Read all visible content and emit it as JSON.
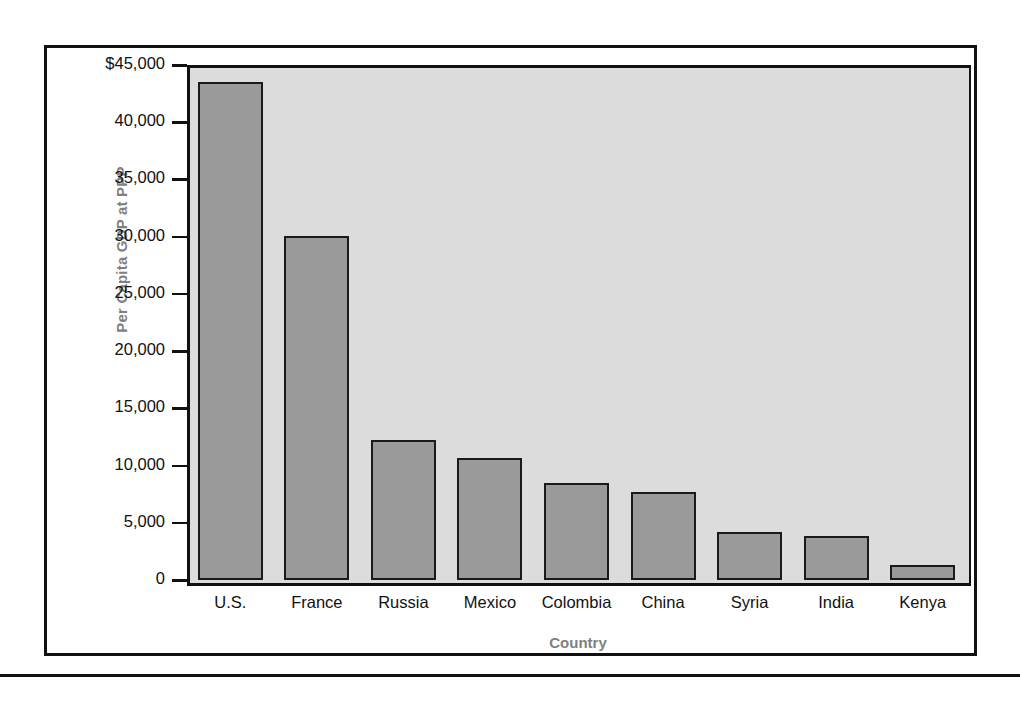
{
  "chart_data": {
    "type": "bar",
    "title": "",
    "xlabel": "Country",
    "ylabel": "Per Capita GDP at PPP",
    "categories": [
      "U.S.",
      "France",
      "Russia",
      "Mexico",
      "Colombia",
      "China",
      "Syria",
      "India",
      "Kenya"
    ],
    "values": [
      43500,
      30100,
      12200,
      10700,
      8500,
      7700,
      4200,
      3850,
      1350
    ],
    "ylim": [
      0,
      45000
    ],
    "ytick_values": [
      45000,
      40000,
      35000,
      30000,
      25000,
      20000,
      15000,
      10000,
      5000,
      0
    ],
    "ytick_labels": [
      "$45,000",
      "40,000",
      "35,000",
      "30,000",
      "25,000",
      "20,000",
      "15,000",
      "10,000",
      "5,000",
      "0"
    ],
    "grid": false,
    "legend": null,
    "colors": {
      "bar_fill": "#9a9a9a",
      "bar_border": "#1a1a1a",
      "plot_background": "#dcdcdc",
      "axis_title": "#808080",
      "tick_label": "#111111",
      "frame": "#111111"
    }
  }
}
